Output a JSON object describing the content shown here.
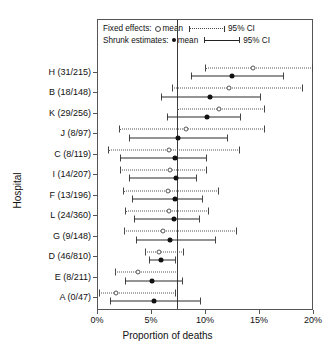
{
  "chart_data": {
    "type": "scatter",
    "plot_kind": "forest-plot",
    "title": "",
    "xlabel": "Proportion of deaths",
    "ylabel": "Hospital",
    "xlim": [
      0,
      20
    ],
    "xunit": "%",
    "xticks": [
      0,
      5,
      10,
      15,
      20
    ],
    "xticklabels": [
      "0%",
      "5%",
      "10%",
      "15%",
      "20%"
    ],
    "grid": false,
    "reference_line": 7.4,
    "legend": {
      "position": "top-inside",
      "entries": [
        {
          "label": "Fixed effects:",
          "mean_label": "mean",
          "ci_label": "95% CI",
          "marker": "open-circle",
          "line_style": "dotted",
          "marker_icon": "open-circle-icon",
          "line_icon": "dotted-interval-icon"
        },
        {
          "label": "Shrunk estimates:",
          "mean_label": "mean",
          "ci_label": "95% CI",
          "marker": "filled-circle",
          "line_style": "solid",
          "marker_icon": "filled-circle-icon",
          "line_icon": "solid-interval-icon"
        }
      ]
    },
    "categories": [
      "H (31/215)",
      "B (18/148)",
      "K (29/256)",
      "J (8/97)",
      "C (8/119)",
      "I (14/207)",
      "F (13/196)",
      "L (24/360)",
      "G (9/148)",
      "D (46/810)",
      "E (8/211)",
      "A (0/47)"
    ],
    "series": [
      {
        "name": "Fixed effects",
        "marker": "open-circle",
        "line_style": "dotted",
        "values": [
          14.4,
          12.2,
          11.3,
          8.2,
          6.7,
          6.8,
          6.6,
          6.7,
          6.1,
          5.7,
          3.8,
          1.8
        ],
        "ci_low": [
          10.0,
          6.9,
          7.4,
          2.0,
          1.0,
          2.1,
          2.4,
          2.6,
          2.5,
          4.4,
          1.7,
          0.2
        ],
        "ci_high": [
          20.0,
          19.1,
          15.6,
          15.6,
          13.2,
          10.2,
          11.3,
          10.4,
          13.0,
          8.1,
          7.5,
          7.3
        ]
      },
      {
        "name": "Shrunk estimates",
        "marker": "filled-circle",
        "line_style": "solid",
        "values": [
          12.5,
          10.5,
          10.2,
          7.5,
          7.2,
          7.3,
          7.2,
          7.1,
          6.8,
          5.9,
          5.1,
          5.3
        ],
        "ci_low": [
          8.7,
          5.9,
          6.5,
          3.0,
          2.1,
          3.0,
          3.2,
          3.4,
          3.6,
          4.8,
          2.6,
          1.2
        ],
        "ci_high": [
          17.3,
          15.2,
          13.3,
          12.1,
          10.2,
          9.3,
          9.8,
          9.5,
          11.0,
          7.3,
          8.0,
          9.6
        ]
      }
    ]
  }
}
